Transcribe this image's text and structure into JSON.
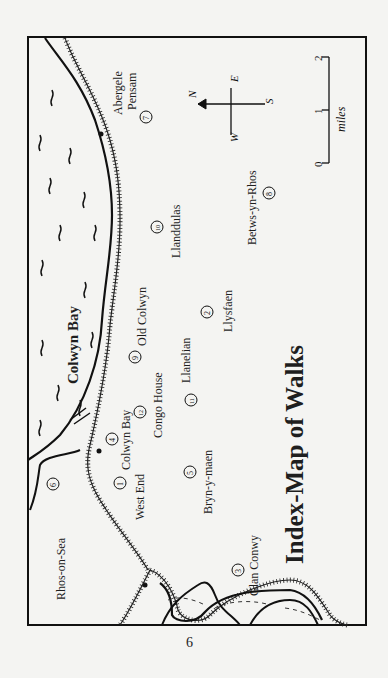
{
  "map": {
    "title": "Index-Map of Walks",
    "sea_label": "Colwyn Bay",
    "places": [
      {
        "id": "rhos-on-sea",
        "name": "Rhos-on-Sea"
      },
      {
        "id": "west-end",
        "name": "West End"
      },
      {
        "id": "colwyn-bay",
        "name": "Colwyn Bay"
      },
      {
        "id": "congo-house",
        "name": "Congo House"
      },
      {
        "id": "old-colwyn",
        "name": "Old Colwyn"
      },
      {
        "id": "llanelian",
        "name": "Llanelian"
      },
      {
        "id": "llysfaen",
        "name": "Llysfaen"
      },
      {
        "id": "llanddulas",
        "name": "Llanddulas"
      },
      {
        "id": "betws-yn-rhos",
        "name": "Betws-yn-Rhos"
      },
      {
        "id": "abergele",
        "name": "Abergele"
      },
      {
        "id": "pensam",
        "name": "Pensam"
      },
      {
        "id": "bryn-y-maen",
        "name": "Bryn-y-maen"
      },
      {
        "id": "glan-conwy",
        "name": "Glan Conwy"
      }
    ],
    "walks": [
      "1",
      "2",
      "3",
      "4",
      "5",
      "6",
      "7",
      "8",
      "9",
      "10",
      "11",
      "12"
    ],
    "compass": {
      "n": "N",
      "s": "S",
      "e": "E",
      "w": "W"
    },
    "scale": {
      "ticks": [
        "0",
        "1",
        "2"
      ],
      "unit": "miles"
    }
  },
  "page": {
    "number": "6"
  }
}
